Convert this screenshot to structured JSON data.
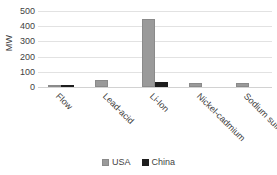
{
  "chart_data": {
    "type": "bar",
    "title": "",
    "subtitle": "",
    "xlabel": "",
    "ylabel": "MW",
    "ylim": [
      0,
      500
    ],
    "yticks": [
      0,
      100,
      200,
      300,
      400,
      500
    ],
    "ytick_labels": [
      "0",
      "100",
      "200",
      "300",
      "400",
      "500"
    ],
    "grid": true,
    "grid_axis": "y",
    "legend_position": "bottom-center",
    "categories": [
      "Flow",
      "Lead-acid",
      "Li-Ion",
      "Nickel-cadmium",
      "Sodium sulfur"
    ],
    "series": [
      {
        "name": "USA",
        "color": "#9a9a9a",
        "values": [
          6,
          48,
          450,
          25,
          24
        ]
      },
      {
        "name": "China",
        "color": "#1d1d1d",
        "values": [
          12,
          0,
          35,
          0,
          0
        ]
      }
    ]
  },
  "legend": {
    "entries": [
      {
        "label": "USA",
        "swatch": "usa-legend-swatch"
      },
      {
        "label": "China",
        "swatch": "china-legend-swatch"
      }
    ]
  }
}
